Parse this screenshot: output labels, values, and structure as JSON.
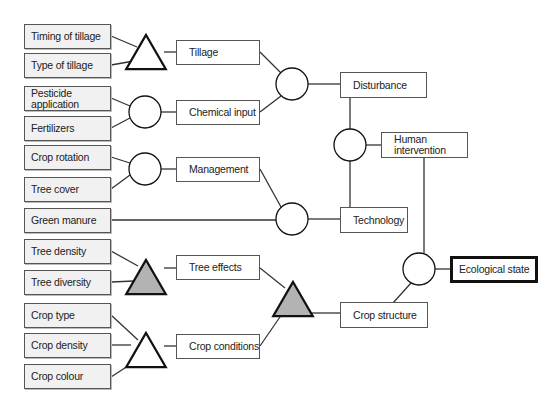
{
  "diagram": {
    "inputs": [
      {
        "id": "timing-of-tillage",
        "label": "Timing of tillage",
        "x": 24,
        "y": 24,
        "w": 87,
        "h": 25
      },
      {
        "id": "type-of-tillage",
        "label": "Type of tillage",
        "x": 24,
        "y": 53,
        "w": 87,
        "h": 25
      },
      {
        "id": "pesticide-application",
        "label": "Pesticide application",
        "x": 24,
        "y": 86,
        "w": 87,
        "h": 25
      },
      {
        "id": "fertilizers",
        "label": "Fertilizers",
        "x": 24,
        "y": 116,
        "w": 87,
        "h": 25
      },
      {
        "id": "crop-rotation",
        "label": "Crop rotation",
        "x": 24,
        "y": 145,
        "w": 87,
        "h": 25
      },
      {
        "id": "tree-cover",
        "label": "Tree cover",
        "x": 24,
        "y": 177,
        "w": 87,
        "h": 25
      },
      {
        "id": "green-manure",
        "label": "Green manure",
        "x": 24,
        "y": 208,
        "w": 87,
        "h": 25
      },
      {
        "id": "tree-density",
        "label": "Tree density",
        "x": 24,
        "y": 239,
        "w": 87,
        "h": 25
      },
      {
        "id": "tree-diversity",
        "label": "Tree diversity",
        "x": 24,
        "y": 270,
        "w": 87,
        "h": 25
      },
      {
        "id": "crop-type",
        "label": "Crop type",
        "x": 24,
        "y": 303,
        "w": 87,
        "h": 25
      },
      {
        "id": "crop-density",
        "label": "Crop density",
        "x": 24,
        "y": 333,
        "w": 87,
        "h": 25
      },
      {
        "id": "crop-colour",
        "label": "Crop colour",
        "x": 24,
        "y": 364,
        "w": 87,
        "h": 25
      }
    ],
    "intermediates": [
      {
        "id": "tillage",
        "label": "Tillage",
        "x": 176,
        "y": 40,
        "w": 84,
        "h": 25
      },
      {
        "id": "chemical-input",
        "label": "Chemical input",
        "x": 176,
        "y": 100,
        "w": 84,
        "h": 25
      },
      {
        "id": "management",
        "label": "Management",
        "x": 176,
        "y": 157,
        "w": 84,
        "h": 25
      },
      {
        "id": "tree-effects",
        "label": "Tree effects",
        "x": 176,
        "y": 255,
        "w": 84,
        "h": 25
      },
      {
        "id": "crop-conditions",
        "label": "Crop conditions",
        "x": 176,
        "y": 334,
        "w": 84,
        "h": 25
      },
      {
        "id": "disturbance",
        "label": "Disturbance",
        "x": 340,
        "y": 72,
        "w": 87,
        "h": 26
      },
      {
        "id": "technology",
        "label": "Technology",
        "x": 340,
        "y": 207,
        "w": 68,
        "h": 26
      },
      {
        "id": "human-intervention",
        "label": "Human intervention",
        "x": 381,
        "y": 132,
        "w": 87,
        "h": 26
      },
      {
        "id": "crop-structure",
        "label": "Crop structure",
        "x": 340,
        "y": 302,
        "w": 88,
        "h": 26
      }
    ],
    "output": {
      "id": "ecological-state",
      "label": "Ecological state",
      "x": 450,
      "y": 256,
      "w": 88,
      "h": 27
    },
    "nodes": [
      {
        "id": "tri-tillage",
        "shape": "triangle",
        "fill": "#ffffff",
        "cx": 146,
        "cy": 52,
        "r": 18
      },
      {
        "id": "circ-chemical",
        "shape": "circle",
        "fill": "#ffffff",
        "cx": 145,
        "cy": 112,
        "r": 16
      },
      {
        "id": "circ-management",
        "shape": "circle",
        "fill": "#ffffff",
        "cx": 145,
        "cy": 169,
        "r": 16
      },
      {
        "id": "circ-disturbance",
        "shape": "circle",
        "fill": "#ffffff",
        "cx": 292,
        "cy": 84,
        "r": 16
      },
      {
        "id": "circ-technology",
        "shape": "circle",
        "fill": "#ffffff",
        "cx": 292,
        "cy": 219,
        "r": 16
      },
      {
        "id": "circ-human",
        "shape": "circle",
        "fill": "#ffffff",
        "cx": 350,
        "cy": 145,
        "r": 16
      },
      {
        "id": "tri-tree-effects",
        "shape": "triangle",
        "fill": "#b3b3b3",
        "cx": 146,
        "cy": 277,
        "r": 18
      },
      {
        "id": "tri-crop-conditions",
        "shape": "triangle",
        "fill": "#ffffff",
        "cx": 146,
        "cy": 350,
        "r": 18
      },
      {
        "id": "tri-crop-structure",
        "shape": "triangle",
        "fill": "#b3b3b3",
        "cx": 293,
        "cy": 299,
        "r": 18
      },
      {
        "id": "circ-ecological",
        "shape": "circle",
        "fill": "#ffffff",
        "cx": 419,
        "cy": 269,
        "r": 16
      }
    ],
    "edges": [
      [
        111,
        36,
        137,
        47
      ],
      [
        111,
        65,
        134,
        61
      ],
      [
        164,
        52,
        176,
        52
      ],
      [
        111,
        98,
        130,
        106
      ],
      [
        111,
        128,
        130,
        118
      ],
      [
        161,
        112,
        176,
        112
      ],
      [
        111,
        157,
        130,
        163
      ],
      [
        111,
        189,
        130,
        175
      ],
      [
        161,
        169,
        176,
        169
      ],
      [
        111,
        220,
        276,
        220
      ],
      [
        260,
        169,
        281,
        207
      ],
      [
        308,
        219,
        340,
        219
      ],
      [
        260,
        52,
        281,
        73
      ],
      [
        260,
        112,
        281,
        96
      ],
      [
        308,
        84,
        340,
        84
      ],
      [
        350,
        98,
        350,
        129
      ],
      [
        350,
        161,
        350,
        207
      ],
      [
        366,
        145,
        381,
        145
      ],
      [
        111,
        251,
        138,
        266
      ],
      [
        111,
        282,
        134,
        281
      ],
      [
        164,
        268,
        176,
        268
      ],
      [
        111,
        315,
        138,
        340
      ],
      [
        111,
        345,
        131,
        345
      ],
      [
        111,
        377,
        134,
        362
      ],
      [
        164,
        346,
        176,
        346
      ],
      [
        260,
        268,
        285,
        288
      ],
      [
        260,
        346,
        282,
        314
      ],
      [
        311,
        313,
        340,
        313
      ],
      [
        384,
        313,
        411,
        283
      ],
      [
        424,
        158,
        424,
        253
      ],
      [
        435,
        269,
        450,
        269
      ]
    ],
    "colors": {
      "line": "#333333",
      "input_fill": "#f1f1f1",
      "gray_node": "#b3b3b3",
      "border": "#555555"
    }
  }
}
